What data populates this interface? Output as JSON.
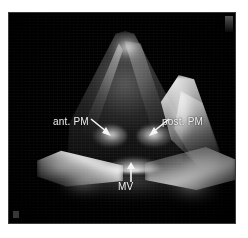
{
  "figure": {
    "modality": "echocardiography",
    "background_color": "#ffffff",
    "scan_background_color": "#000000",
    "frame": {
      "left": 9,
      "top": 13,
      "width": 226,
      "height": 210
    }
  },
  "annotations": [
    {
      "id": "ant-pm",
      "label": "ant. PM",
      "meaning": "anterior papillary muscle",
      "text_color": "#f2f2f2",
      "arrow_direction": "down-right",
      "label_position": {
        "x": 44,
        "y": 103
      },
      "arrow_tip": {
        "x": 101,
        "y": 123
      }
    },
    {
      "id": "post-pm",
      "label": "post. PM",
      "meaning": "posterior papillary muscle",
      "text_color": "#f2f2f2",
      "arrow_direction": "down-left",
      "label_position": {
        "x": 153,
        "y": 103
      },
      "arrow_tip": {
        "x": 138,
        "y": 123
      }
    },
    {
      "id": "mv",
      "label": "MV",
      "meaning": "mitral valve",
      "text_color": "#f2f2f2",
      "arrow_direction": "up",
      "label_position": {
        "x": 109,
        "y": 168
      },
      "arrow_tip": {
        "x": 122,
        "y": 149
      }
    }
  ],
  "structures": [
    {
      "name": "lv-apex-cone",
      "description": "left ventricular apex forming the bright pyramidal apex at the top of the sector"
    },
    {
      "name": "lateral-ridge",
      "description": "bright lateral myocardial ridge on the right side of the cavity"
    },
    {
      "name": "ant-pm-body",
      "description": "anterior papillary muscle head"
    },
    {
      "name": "post-pm-body",
      "description": "posterior papillary muscle head"
    },
    {
      "name": "mv-annulus",
      "description": "bright mitral annulus arc"
    },
    {
      "name": "basal-wings",
      "description": "broad bright basal myocardial wings sweeping left and right"
    }
  ],
  "markers": {
    "top_right": "scan-corner-marker",
    "bottom_left": "scan-corner-marker"
  }
}
